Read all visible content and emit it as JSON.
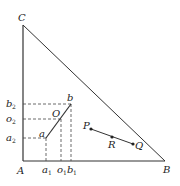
{
  "diagram": {
    "type": "triangle-geometry",
    "colors": {
      "stroke": "#333333",
      "background": "#ffffff"
    },
    "vertices": {
      "A": {
        "label": "A",
        "x": 23,
        "y": 161
      },
      "B": {
        "label": "B",
        "x": 165,
        "y": 161
      },
      "C": {
        "label": "C",
        "x": 23,
        "y": 25
      }
    },
    "segment_ab": {
      "a": {
        "label": "a",
        "x": 46,
        "y": 138
      },
      "O": {
        "label": "O",
        "x": 61,
        "y": 119
      },
      "b": {
        "label": "b",
        "x": 71,
        "y": 104
      }
    },
    "axis_ticks": {
      "x": [
        {
          "base": "a",
          "sub": "1"
        },
        {
          "base": "o",
          "sub": "1"
        },
        {
          "base": "b",
          "sub": "1"
        }
      ],
      "y": [
        {
          "base": "b",
          "sub": "2"
        },
        {
          "base": "o",
          "sub": "2"
        },
        {
          "base": "a",
          "sub": "2"
        }
      ]
    },
    "segment_pq": {
      "P": {
        "label": "P",
        "x": 91,
        "y": 129
      },
      "R": {
        "label": "R",
        "x": 112,
        "y": 137
      },
      "Q": {
        "label": "Q",
        "x": 133,
        "y": 144
      }
    }
  }
}
